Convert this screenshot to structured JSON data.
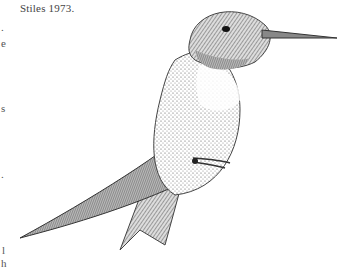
{
  "caption": "Stiles 1973.",
  "left_margin_fragments": [
    {
      "text": ".",
      "x": 1,
      "y": 21
    },
    {
      "text": "e",
      "x": 1,
      "y": 37
    },
    {
      "text": "s",
      "x": 1,
      "y": 102
    },
    {
      "text": ".",
      "x": 1,
      "y": 168
    },
    {
      "text": "l",
      "x": 2,
      "y": 244
    },
    {
      "text": "h",
      "x": 1,
      "y": 257
    }
  ],
  "illustration": {
    "subject": "hummingbird",
    "style": "pen-and-ink stipple line drawing"
  }
}
